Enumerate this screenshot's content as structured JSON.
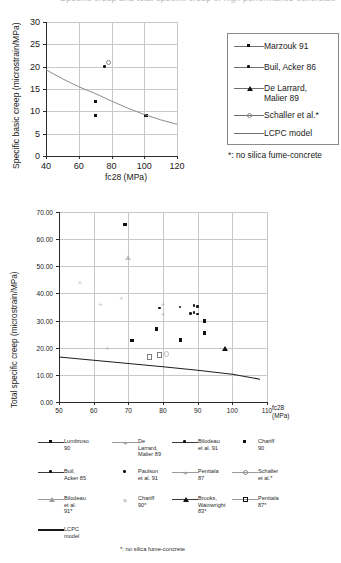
{
  "figure": {
    "cropped_header_text": "Specific creep and total specific creep of high performance concretes",
    "footnote": "*: no silica fume-concrete"
  },
  "chart_data": [
    {
      "id": "top",
      "type": "scatter",
      "title": "",
      "xlabel": "fc28 (MPa)",
      "ylabel": "Specific basic creep (microstrain/MPa)",
      "xlim": [
        40,
        120
      ],
      "ylim": [
        0,
        30
      ],
      "xticks": [
        "40",
        "60",
        "80",
        "100",
        "120"
      ],
      "yticks": [
        "0",
        "5",
        "10",
        "15",
        "20",
        "25",
        "30"
      ],
      "grid": true,
      "legend_position": "right",
      "series": [
        {
          "name": "Marzouk 91",
          "marker": "square",
          "points": [
            [
              70,
              12.3
            ],
            [
              70,
              9.1
            ],
            [
              101,
              9.1
            ]
          ]
        },
        {
          "name": "Buil, Acker 86",
          "marker": "dot",
          "points": [
            [
              76,
              20.0
            ]
          ]
        },
        {
          "name": "De Larrard, Malier 89",
          "marker": "triangle",
          "points": []
        },
        {
          "name": "Schaller et al.*",
          "marker": "circle-open",
          "points": [
            [
              78,
              21.0
            ]
          ]
        },
        {
          "name": "LCPC model",
          "marker": "line",
          "curve": [
            [
              40,
              19.3
            ],
            [
              50,
              17.3
            ],
            [
              60,
              15.5
            ],
            [
              70,
              14.0
            ],
            [
              80,
              12.3
            ],
            [
              90,
              10.7
            ],
            [
              100,
              9.3
            ],
            [
              110,
              8.1
            ],
            [
              120,
              7.1
            ]
          ]
        }
      ]
    },
    {
      "id": "bottom",
      "type": "scatter",
      "title": "",
      "xlabel": "fc28 (MPa)",
      "ylabel": "Total specific creep (microstrain/MPa)",
      "xlim": [
        50,
        110
      ],
      "ylim": [
        0,
        70
      ],
      "xticks": [
        "50",
        "60",
        "70",
        "80",
        "90",
        "100",
        "110"
      ],
      "yticks": [
        "0.00",
        "10.00",
        "20.00",
        "30.00",
        "40.00",
        "50.00",
        "60.00",
        "70.00"
      ],
      "grid": true,
      "legend_position": "bottom",
      "series": [
        {
          "name": "Lumbroso 90",
          "marker": "square",
          "points": [
            [
              69,
              65.4
            ]
          ]
        },
        {
          "name": "De Larrard, Malier 89",
          "marker": "plus",
          "points": [
            [
              62,
              35.7
            ],
            [
              68,
              38.1
            ],
            [
              64,
              19.5
            ]
          ]
        },
        {
          "name": "Bilodeau et al. 91",
          "marker": "dot",
          "points": [
            [
              79,
              34.6
            ],
            [
              85,
              35.0
            ],
            [
              89,
              35.5
            ],
            [
              90,
              35.2
            ]
          ]
        },
        {
          "name": "Chariff 90",
          "marker": "square",
          "points": [
            [
              71,
              22.8
            ],
            [
              78,
              26.9
            ],
            [
              85,
              22.9
            ],
            [
              92,
              29.9
            ],
            [
              92,
              25.5
            ]
          ]
        },
        {
          "name": "Buil, Acker 85",
          "marker": "dot-line",
          "points": [
            [
              89,
              33.0
            ],
            [
              90,
              32.3
            ]
          ]
        },
        {
          "name": "Paulson et al. 91",
          "marker": "dot-only",
          "points": [
            [
              88,
              32.5
            ]
          ]
        },
        {
          "name": "Penttala 87",
          "marker": "plus-line",
          "points": [
            [
              80,
              35.9
            ],
            [
              80,
              32.2
            ]
          ]
        },
        {
          "name": "Schaller et al.*",
          "marker": "circle-open-line",
          "points": [
            [
              81,
              17.8
            ]
          ]
        },
        {
          "name": "Bilodeau et al. 91*",
          "marker": "tri-open-line",
          "points": [
            [
              70,
              53.4
            ]
          ]
        },
        {
          "name": "Chariff 90*",
          "marker": "x-only",
          "points": [
            [
              56,
              44.2
            ]
          ]
        },
        {
          "name": "Brooks, Wainwright 83*",
          "marker": "tri-line",
          "points": [
            [
              98,
              19.6
            ]
          ]
        },
        {
          "name": "Penttala 87*",
          "marker": "square-open-line",
          "points": [
            [
              76,
              16.6
            ],
            [
              79,
              17.4
            ]
          ]
        },
        {
          "name": "LCPC model",
          "marker": "thick-line",
          "curve": [
            [
              50,
              16.6
            ],
            [
              60,
              15.4
            ],
            [
              70,
              14.2
            ],
            [
              80,
              13.0
            ],
            [
              90,
              11.7
            ],
            [
              100,
              10.2
            ],
            [
              108,
              8.4
            ]
          ]
        }
      ]
    }
  ],
  "top_chart": {
    "ylabel": "Specific basic creep (microstrain/MPa)",
    "xlabel": "fc28 (MPa)",
    "xticks": [
      "40",
      "60",
      "80",
      "100",
      "120"
    ],
    "yticks": [
      "30",
      "25",
      "20",
      "15",
      "10",
      "5",
      "0"
    ],
    "legend": [
      {
        "label": "Marzouk 91",
        "marker": "square"
      },
      {
        "label": "Buil, Acker 86",
        "marker": "dot"
      },
      {
        "label": "De Larrard,\nMalier 89",
        "marker": "triangle"
      },
      {
        "label": "Schaller et al.*",
        "marker": "circle-open"
      },
      {
        "label": "LCPC model",
        "marker": "line"
      }
    ],
    "note": "*: no silica fume-concrete"
  },
  "bottom_chart": {
    "ylabel": "Total specific creep (microstrain/MPa)",
    "xlabel": "fc28\n(MPa)",
    "xticks": [
      "50",
      "60",
      "70",
      "80",
      "90",
      "100",
      "110"
    ],
    "yticks": [
      "70.00",
      "60.00",
      "50.00",
      "40.00",
      "30.00",
      "20.00",
      "10.00",
      "0.00"
    ],
    "legend_rows": [
      [
        {
          "label": "Lumbroso\n90",
          "marker": "square"
        },
        {
          "label": "De\nLarrard,\nMalier 89",
          "marker": "plus"
        },
        {
          "label": "Bilodeau\net al. 91",
          "marker": "dot"
        },
        {
          "label": "Chariff\n90",
          "marker": "square-nolne"
        }
      ],
      [
        {
          "label": "Buil,\nAcker 85",
          "marker": "dot"
        },
        {
          "label": "Paulson\net al. 91",
          "marker": "dot-nolne"
        },
        {
          "label": "Penttala\n87",
          "marker": "plus"
        },
        {
          "label": "Schaller\net al.*",
          "marker": "circle-open"
        }
      ],
      [
        {
          "label": "Bilodeau\net al.\n91*",
          "marker": "tri-open"
        },
        {
          "label": "Chariff\n90*",
          "marker": "x-nolne"
        },
        {
          "label": "Brooks,\nWainwright\n83*",
          "marker": "triangle"
        },
        {
          "label": "Penttala\n87*",
          "marker": "square-open"
        }
      ],
      [
        {
          "label": "LCPC\nmodel",
          "marker": "thick-line"
        }
      ]
    ],
    "note": "*: no silica fume-concrete"
  }
}
